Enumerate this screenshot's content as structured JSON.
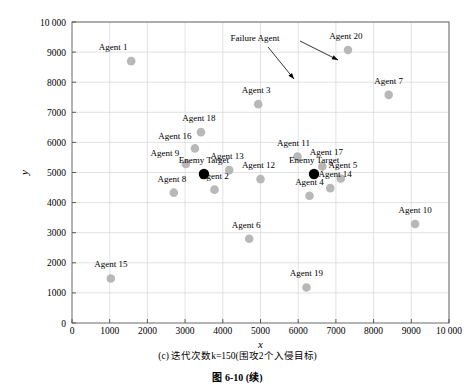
{
  "figure": {
    "subcaption": "(c) 迭代次数k=150(围攻2个入侵目标)",
    "figure_number": "图 6-10",
    "figure_continued": "(续)"
  },
  "chart_data": {
    "type": "scatter",
    "title": "",
    "xlabel": "x",
    "ylabel": "y",
    "xlim": [
      0,
      10000
    ],
    "ylim": [
      0,
      10000
    ],
    "grid": true,
    "legend_position": "none",
    "xticks": [
      "0",
      "1000",
      "2000",
      "3000",
      "4000",
      "5000",
      "6000",
      "7000",
      "8000",
      "9000",
      "10 000"
    ],
    "yticks": [
      "0",
      "1000",
      "2000",
      "3000",
      "4000",
      "5000",
      "6000",
      "7000",
      "8000",
      "9000",
      "10 000"
    ],
    "xtick_values": [
      0,
      1000,
      2000,
      3000,
      4000,
      5000,
      6000,
      7000,
      8000,
      9000,
      10000
    ],
    "ytick_values": [
      0,
      1000,
      2000,
      3000,
      4000,
      5000,
      6000,
      7000,
      8000,
      9000,
      10000
    ],
    "series": [
      {
        "name": "Agents",
        "marker": "circle",
        "color": "#b8b8b8",
        "points": [
          {
            "label": "Agent 1",
            "x": 1570,
            "y": 8700,
            "label_dx": -18,
            "label_dy": -11
          },
          {
            "label": "Agent 2",
            "x": 3780,
            "y": 4430,
            "label_dx": 0,
            "label_dy": -11
          },
          {
            "label": "Agent 3",
            "x": 4940,
            "y": 7270,
            "label_dx": -2,
            "label_dy": -11
          },
          {
            "label": "Agent 4",
            "x": 6300,
            "y": 4230,
            "label_dx": 0,
            "label_dy": -11
          },
          {
            "label": "Agent 5",
            "x": 7130,
            "y": 4800,
            "label_dx": 2,
            "label_dy": -11
          },
          {
            "label": "Agent 6",
            "x": 4700,
            "y": 2800,
            "label_dx": -3,
            "label_dy": -11
          },
          {
            "label": "Agent 7",
            "x": 8400,
            "y": 7580,
            "label_dx": 0,
            "label_dy": -11
          },
          {
            "label": "Agent 8",
            "x": 2700,
            "y": 4330,
            "label_dx": -2,
            "label_dy": -11
          },
          {
            "label": "Agent 9",
            "x": 3020,
            "y": 5280,
            "label_dx": -21,
            "label_dy": -8
          },
          {
            "label": "Agent 10",
            "x": 9100,
            "y": 3290,
            "label_dx": 0,
            "label_dy": -11
          },
          {
            "label": "Agent 11",
            "x": 5980,
            "y": 5530,
            "label_dx": -4,
            "label_dy": -11
          },
          {
            "label": "Agent 12",
            "x": 5000,
            "y": 4780,
            "label_dx": -2,
            "label_dy": -11
          },
          {
            "label": "Agent 13",
            "x": 4170,
            "y": 5080,
            "label_dx": -2,
            "label_dy": -11
          },
          {
            "label": "Agent 14",
            "x": 6850,
            "y": 4480,
            "label_dx": 5,
            "label_dy": -11
          },
          {
            "label": "Agent 15",
            "x": 1030,
            "y": 1480,
            "label_dx": 0,
            "label_dy": -11
          },
          {
            "label": "Agent 16",
            "x": 3260,
            "y": 5800,
            "label_dx": -20,
            "label_dy": -9
          },
          {
            "label": "Agent 17",
            "x": 6640,
            "y": 5200,
            "label_dx": 4,
            "label_dy": -11
          },
          {
            "label": "Agent 18",
            "x": 3420,
            "y": 6340,
            "label_dx": -2,
            "label_dy": -11
          },
          {
            "label": "Agent 19",
            "x": 6220,
            "y": 1180,
            "label_dx": 0,
            "label_dy": -11
          },
          {
            "label": "Agent 20",
            "x": 7320,
            "y": 9070,
            "label_dx": -2,
            "label_dy": -11
          }
        ]
      },
      {
        "name": "Enemy Target",
        "marker": "circle-filled",
        "color": "#000000",
        "points": [
          {
            "label": "Enemy Target",
            "x": 3500,
            "y": 4950,
            "label_dx": 0,
            "label_dy": -11
          },
          {
            "label": "Enemy Target",
            "x": 6420,
            "y": 4950,
            "label_dx": 0,
            "label_dy": -11
          }
        ]
      }
    ],
    "annotations": [
      {
        "text": "Failure Agent",
        "text_x": 255,
        "text_y": 41,
        "arrows": [
          {
            "from_x": 268,
            "from_y": 47,
            "to_x": 294,
            "to_y": 79
          },
          {
            "from_x": 300,
            "from_y": 41,
            "to_x": 338,
            "to_y": 60
          }
        ]
      }
    ]
  }
}
